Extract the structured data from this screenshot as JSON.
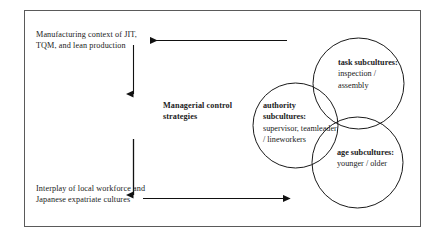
{
  "diagram": {
    "frame": {
      "border_color": "#5a5a5a"
    },
    "flow_blocks": [
      {
        "id": "manufacturing",
        "text": "Manufacturing context of JIT, TQM, and lean production"
      },
      {
        "id": "managerial",
        "text": "Managerial control strategies"
      },
      {
        "id": "interplay",
        "text": "Interplay of local workforce and Japanese expatriate cultures"
      }
    ],
    "arrows": [
      {
        "id": "feedback-to-manufacturing",
        "direction": "left",
        "label": ""
      },
      {
        "id": "manufacturing-to-managerial",
        "direction": "down",
        "label": ""
      },
      {
        "id": "managerial-to-interplay",
        "direction": "down",
        "label": ""
      },
      {
        "id": "interplay-to-subcultures",
        "direction": "right",
        "label": ""
      }
    ],
    "venn": {
      "circles": [
        {
          "id": "authority",
          "heading": "authority subcultures:",
          "body": "supervisor, teamleader / lineworkers"
        },
        {
          "id": "task",
          "heading": "task subcultures:",
          "body": "inspection / assembly"
        },
        {
          "id": "age",
          "heading": "age subcultures:",
          "body": "younger / older"
        }
      ],
      "stroke_color": "#1a1a1a"
    }
  }
}
